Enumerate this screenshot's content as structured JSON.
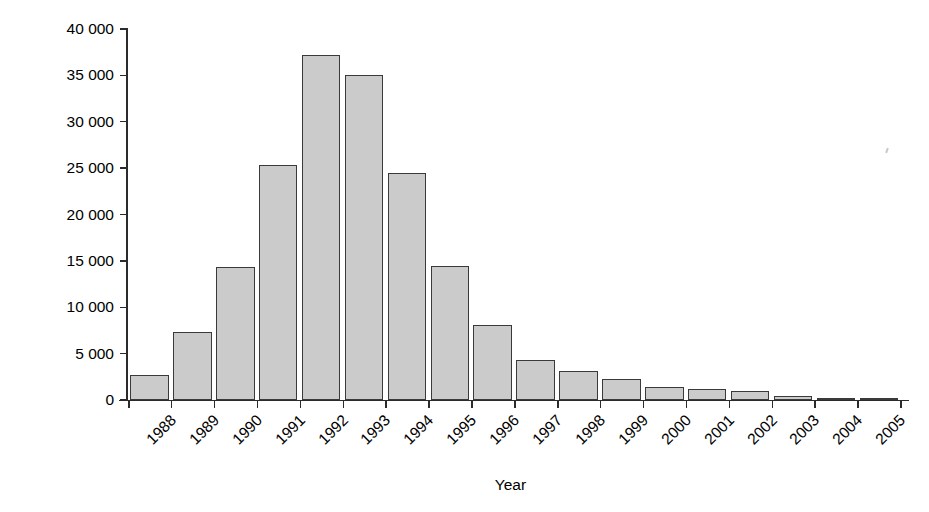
{
  "chart_data": {
    "type": "bar",
    "title": "",
    "xlabel": "Year",
    "ylabel": "No. of cases",
    "categories": [
      "1988",
      "1989",
      "1990",
      "1991",
      "1992",
      "1993",
      "1994",
      "1995",
      "1996",
      "1997",
      "1998",
      "1999",
      "2000",
      "2001",
      "2002",
      "2003",
      "2004",
      "2005"
    ],
    "values": [
      2700,
      7300,
      14300,
      25300,
      37200,
      35000,
      24500,
      14500,
      8100,
      4300,
      3150,
      2250,
      1400,
      1150,
      1000,
      450,
      250,
      100
    ],
    "ylim": [
      0,
      40000
    ],
    "ytick_values": [
      0,
      5000,
      10000,
      15000,
      20000,
      25000,
      30000,
      35000,
      40000
    ],
    "ytick_labels": [
      "0",
      "5 000",
      "10 000",
      "15 000",
      "20 000",
      "25 000",
      "30 000",
      "35 000",
      "40 000"
    ],
    "grid": false,
    "legend": null,
    "bar_color": "#cbcbcb",
    "bar_edge_color": "#3a3a3a",
    "axis_color": "#2b2b2b",
    "xtick_label_rotation": -45
  }
}
